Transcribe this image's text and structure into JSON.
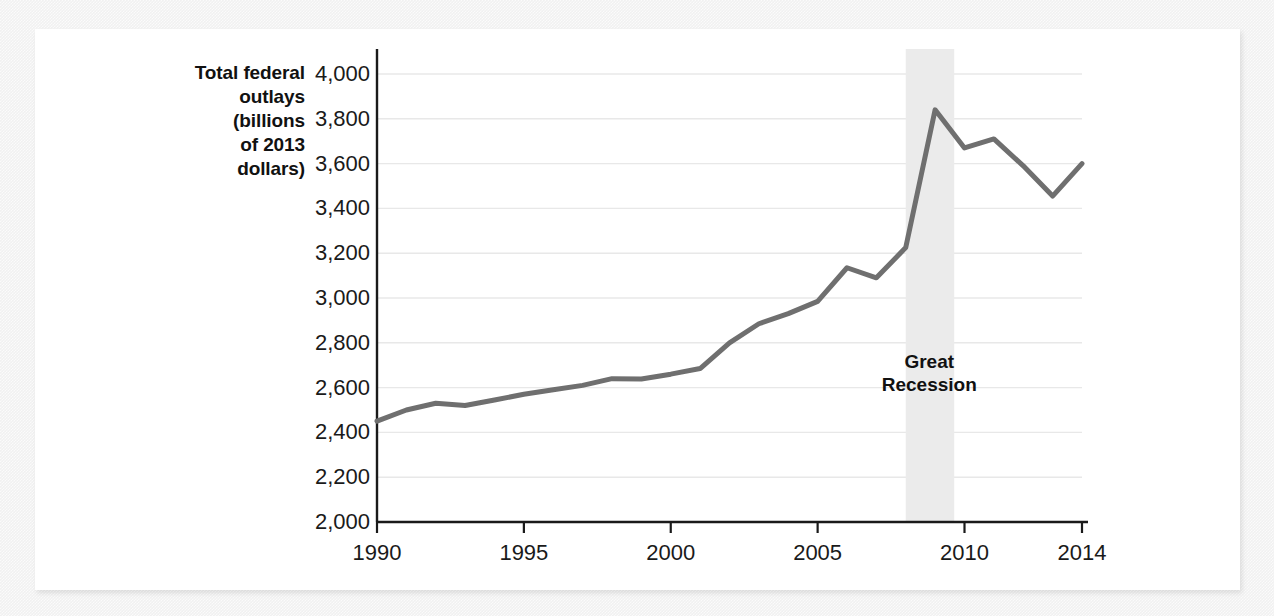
{
  "figure": {
    "y_axis_title": "Total federal\noutlays\n(billions\nof 2013\ndollars)",
    "annotation_label": "Great\nRecession"
  },
  "chart_data": {
    "type": "line",
    "title": "",
    "xlabel": "",
    "ylabel": "Total federal outlays (billions of 2013 dollars)",
    "xlim": [
      1990,
      2014
    ],
    "ylim": [
      2000,
      4000
    ],
    "ytick_values": [
      2000,
      2200,
      2400,
      2600,
      2800,
      3000,
      3200,
      3400,
      3600,
      3800,
      4000
    ],
    "ytick_labels": [
      "2,000",
      "2,200",
      "2,400",
      "2,600",
      "2,800",
      "3,000",
      "3,200",
      "3,400",
      "3,600",
      "3,800",
      "4,000"
    ],
    "xtick_values": [
      1990,
      1995,
      2000,
      2005,
      2010,
      2014
    ],
    "xtick_labels": [
      "1990",
      "1995",
      "2000",
      "2005",
      "2010",
      "2014"
    ],
    "grid": true,
    "legend": false,
    "line_color": "#6f6f6f",
    "grid_color": "#e8e8e8",
    "axis_color": "#1a1a1a",
    "shade_color": "#ebebeb",
    "x": [
      1990,
      1991,
      1992,
      1993,
      1994,
      1995,
      1996,
      1997,
      1998,
      1999,
      2000,
      2001,
      2002,
      2003,
      2004,
      2005,
      2006,
      2007,
      2008,
      2009,
      2010,
      2011,
      2012,
      2013,
      2014
    ],
    "values": [
      2450,
      2500,
      2530,
      2520,
      2545,
      2570,
      2590,
      2610,
      2640,
      2638,
      2660,
      2685,
      2800,
      2885,
      2930,
      2985,
      3135,
      3090,
      3225,
      3840,
      3670,
      3710,
      3590,
      3455,
      3600
    ],
    "annotations": [
      {
        "text": "Great Recession",
        "type": "vspan",
        "x_start": 2008.0,
        "x_end": 2009.65,
        "label_x": 2008.8,
        "label_y": 2660
      }
    ]
  }
}
